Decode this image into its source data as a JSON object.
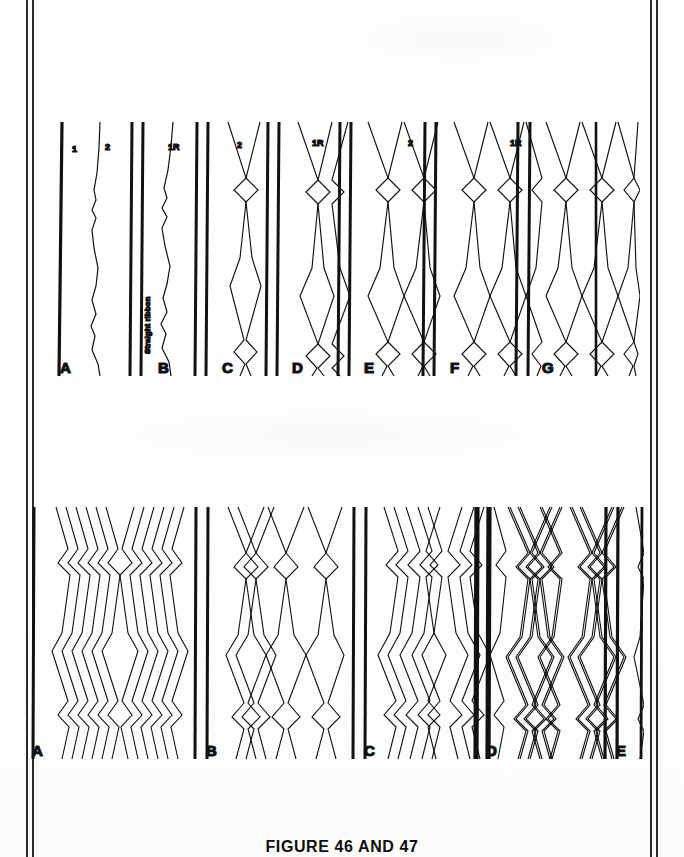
{
  "page": {
    "background_color": "#ffffff",
    "ink_color": "#111111",
    "gutter_rule_color": "#2a2a2a"
  },
  "caption": {
    "text": "FIGURE 46 AND 47"
  },
  "top_row": {
    "column_labels": [
      {
        "text": "1",
        "x": 72,
        "y": 150
      },
      {
        "text": "2",
        "x": 105,
        "y": 148
      },
      {
        "text": "1R",
        "x": 168,
        "y": 148
      },
      {
        "text": "2",
        "x": 237,
        "y": 145
      },
      {
        "text": "1R",
        "x": 312,
        "y": 145
      },
      {
        "text": "2",
        "x": 408,
        "y": 145
      },
      {
        "text": "1R",
        "x": 510,
        "y": 145
      }
    ],
    "vertical_note": {
      "text": "Straight ribbon",
      "x": 148,
      "y": 340
    },
    "panels": [
      {
        "label": "A",
        "strands": 1,
        "pattern": "single-zigzag",
        "x": 58,
        "width": 62
      },
      {
        "label": "B",
        "strands": 1,
        "pattern": "single-zigzag-straight-ribbon",
        "x": 128,
        "width": 62
      },
      {
        "label": "C",
        "strands": 2,
        "pattern": "two-diamond",
        "x": 193,
        "width": 60
      },
      {
        "label": "D",
        "strands": 3,
        "pattern": "three-diamond",
        "x": 264,
        "width": 72
      },
      {
        "label": "E",
        "strands": 4,
        "pattern": "four-diamond",
        "x": 345,
        "width": 80
      },
      {
        "label": "F",
        "strands": 5,
        "pattern": "five-diamond",
        "x": 430,
        "width": 88
      },
      {
        "label": "G",
        "strands": 6,
        "pattern": "six-diamond",
        "x": 525,
        "width": 98
      }
    ]
  },
  "bottom_row": {
    "panels": [
      {
        "label": "A",
        "strands": 12,
        "pattern": "dense-zigzag-multi",
        "x": 30,
        "width": 125
      },
      {
        "label": "B",
        "strands": 8,
        "pattern": "open-diamond-multi",
        "x": 165,
        "width": 125
      },
      {
        "label": "C",
        "strands": 10,
        "pattern": "medium-diamond-multi",
        "x": 300,
        "width": 125
      },
      {
        "label": "D",
        "strands": 9,
        "pattern": "wide-diamond-multi",
        "x": 425,
        "width": 120
      },
      {
        "label": "E",
        "strands": 9,
        "pattern": "wide-diamond-multi-b",
        "x": 555,
        "width": 110
      }
    ]
  }
}
